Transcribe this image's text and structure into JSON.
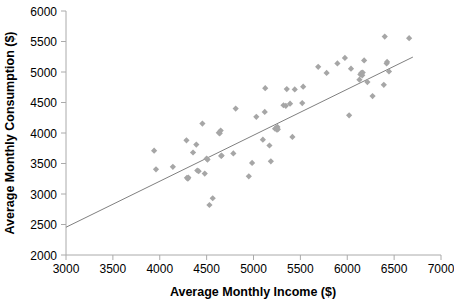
{
  "chart_data": {
    "type": "scatter",
    "title": "",
    "xlabel": "Average Monthly Income ($)",
    "ylabel": "Average Monthly Consumption ($)",
    "xlim": [
      3000,
      7000
    ],
    "ylim": [
      2000,
      6000
    ],
    "xticks": [
      3000,
      3500,
      4000,
      4500,
      5000,
      5500,
      6000,
      6500,
      7000
    ],
    "yticks": [
      2000,
      2500,
      3000,
      3500,
      4000,
      4500,
      5000,
      5500,
      6000
    ],
    "xtick_labels": [
      "3000",
      "3500",
      "4000",
      "4500",
      "5000",
      "5500",
      "6000",
      "6500",
      "7000"
    ],
    "ytick_labels": [
      "2000",
      "2500",
      "3000",
      "3500",
      "4000",
      "4500",
      "5000",
      "5500",
      "6000"
    ],
    "grid": false,
    "legend": false,
    "marker_shape": "diamond",
    "marker_color": "#a6a6a6",
    "series": [
      {
        "name": "Households",
        "points": [
          [
            3940,
            3710
          ],
          [
            3960,
            3405
          ],
          [
            4140,
            3445
          ],
          [
            4285,
            3880
          ],
          [
            4290,
            3265
          ],
          [
            4300,
            3250
          ],
          [
            4305,
            3270
          ],
          [
            4355,
            3680
          ],
          [
            4390,
            3810
          ],
          [
            4400,
            3385
          ],
          [
            4415,
            3375
          ],
          [
            4455,
            4155
          ],
          [
            4480,
            3335
          ],
          [
            4500,
            3580
          ],
          [
            4510,
            3565
          ],
          [
            4530,
            2820
          ],
          [
            4565,
            2930
          ],
          [
            4630,
            4005
          ],
          [
            4640,
            3995
          ],
          [
            4650,
            4040
          ],
          [
            4655,
            3625
          ],
          [
            4660,
            3630
          ],
          [
            4785,
            3665
          ],
          [
            4810,
            4400
          ],
          [
            4950,
            3290
          ],
          [
            4985,
            3510
          ],
          [
            5030,
            4265
          ],
          [
            5100,
            3890
          ],
          [
            5120,
            4345
          ],
          [
            5125,
            4735
          ],
          [
            5170,
            3795
          ],
          [
            5185,
            3535
          ],
          [
            5230,
            4070
          ],
          [
            5245,
            4090
          ],
          [
            5250,
            4055
          ],
          [
            5255,
            4100
          ],
          [
            5260,
            4060
          ],
          [
            5320,
            4455
          ],
          [
            5345,
            4445
          ],
          [
            5355,
            4720
          ],
          [
            5390,
            4480
          ],
          [
            5415,
            3935
          ],
          [
            5440,
            4715
          ],
          [
            5520,
            4490
          ],
          [
            5530,
            4760
          ],
          [
            5690,
            5085
          ],
          [
            5780,
            4985
          ],
          [
            5895,
            5140
          ],
          [
            5975,
            5230
          ],
          [
            6020,
            4290
          ],
          [
            6040,
            5055
          ],
          [
            6130,
            4875
          ],
          [
            6140,
            4960
          ],
          [
            6150,
            4985
          ],
          [
            6160,
            4945
          ],
          [
            6165,
            4990
          ],
          [
            6180,
            5190
          ],
          [
            6215,
            4835
          ],
          [
            6270,
            4605
          ],
          [
            6390,
            4790
          ],
          [
            6400,
            5580
          ],
          [
            6420,
            5140
          ],
          [
            6425,
            5165
          ],
          [
            6445,
            5010
          ],
          [
            6660,
            5555
          ]
        ]
      }
    ],
    "trendline": {
      "name": "Linear fit",
      "color": "#808080",
      "x_start": 3000,
      "y_start": 2455,
      "x_end": 6700,
      "y_end": 5245
    }
  }
}
